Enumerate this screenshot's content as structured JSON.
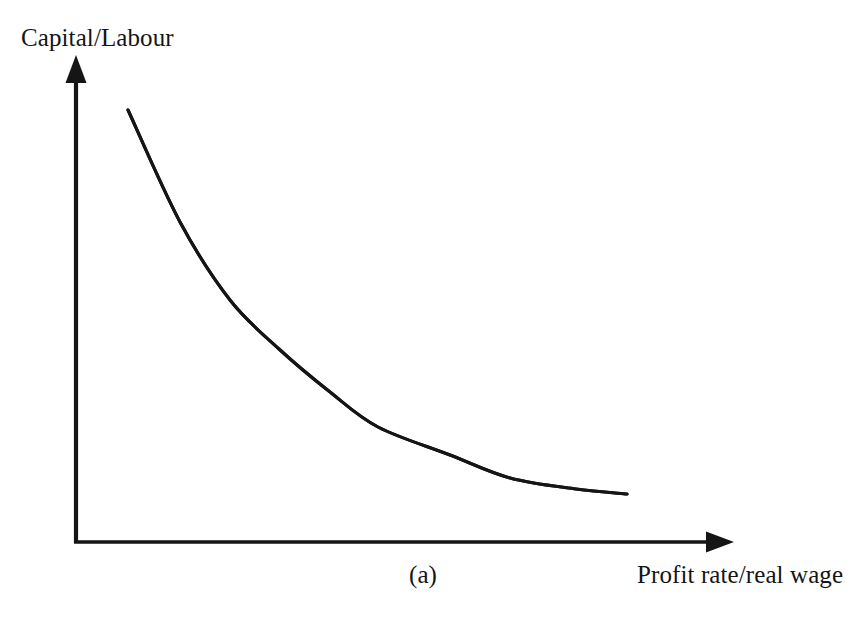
{
  "figure": {
    "caption": "(a)",
    "background_color": "#ffffff",
    "ink_color": "#151515"
  },
  "axes": {
    "y_label": "Capital/Labour",
    "x_label": "Profit rate/real wage",
    "origin": {
      "x": 76,
      "y": 542
    },
    "y_axis_tip": {
      "x": 76,
      "y": 56
    },
    "x_axis_tip": {
      "x": 733,
      "y": 542
    },
    "arrowheads": true,
    "ticks": false,
    "grid": false
  },
  "chart_data": {
    "type": "line",
    "title": "",
    "subtitle": "",
    "xlabel": "Profit rate/real wage",
    "ylabel": "Capital/Labour",
    "annotations": [
      "(a)"
    ],
    "legend": [],
    "legend_position": "none",
    "grid": false,
    "axis_ticks_labeled": false,
    "xlim": [
      0,
      1
    ],
    "ylim": [
      0,
      1
    ],
    "series": [
      {
        "name": "Capital intensity curve",
        "shape": "monotonically decreasing convex",
        "x": [
          0.079,
          0.158,
          0.234,
          0.308,
          0.387,
          0.46,
          0.569,
          0.66,
          0.76,
          0.838
        ],
        "y": [
          0.89,
          0.769,
          0.661,
          0.572,
          0.484,
          0.42,
          0.339,
          0.287,
          0.241,
          0.215
        ],
        "pixel_points": [
          [
            128,
            110
          ],
          [
            180,
            222
          ],
          [
            230,
            300
          ],
          [
            279,
            349
          ],
          [
            330,
            392
          ],
          [
            378,
            427
          ],
          [
            450,
            455
          ],
          [
            510,
            478
          ],
          [
            576,
            489
          ],
          [
            627,
            494
          ]
        ]
      }
    ]
  }
}
